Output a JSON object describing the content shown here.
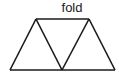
{
  "diagram": {
    "fold_label": "fold",
    "stroke_color": "#1a1a1a",
    "background": "#ffffff",
    "vertices": {
      "top_left": [
        36,
        19
      ],
      "top_right": [
        89,
        19
      ],
      "bottom_left": [
        10,
        70
      ],
      "bottom_mid": [
        62,
        70
      ],
      "bottom_right": [
        115,
        70
      ]
    }
  }
}
